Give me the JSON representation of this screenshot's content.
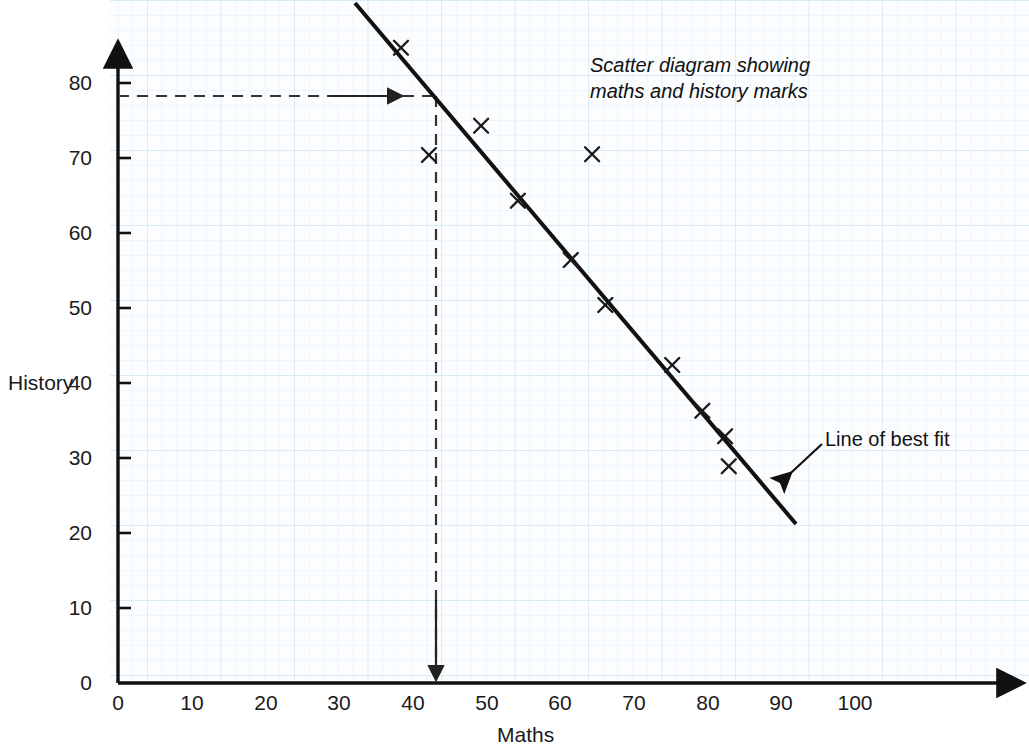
{
  "chart_data": {
    "type": "scatter",
    "title": "Scatter diagram showing maths and history marks",
    "title_line1": "Scatter diagram showing",
    "title_line2": "maths and history marks",
    "xlabel": "Maths",
    "ylabel": "History",
    "xlim": [
      0,
      115
    ],
    "ylim": [
      0,
      90
    ],
    "xticks": [
      0,
      10,
      20,
      30,
      40,
      50,
      60,
      70,
      80,
      90,
      100
    ],
    "yticks": [
      0,
      10,
      20,
      30,
      40,
      50,
      60,
      70,
      80
    ],
    "grid": true,
    "grid_color": "#d9e9f2",
    "marker": "x",
    "marker_color": "#1a1a1a",
    "points": [
      {
        "x": 38.5,
        "y": 84.7
      },
      {
        "x": 42.3,
        "y": 70.4
      },
      {
        "x": 49.4,
        "y": 74.3
      },
      {
        "x": 54.4,
        "y": 64.3
      },
      {
        "x": 61.6,
        "y": 56.4
      },
      {
        "x": 64.5,
        "y": 70.5
      },
      {
        "x": 66.3,
        "y": 50.4
      },
      {
        "x": 75.4,
        "y": 42.4
      },
      {
        "x": 79.5,
        "y": 36.3
      },
      {
        "x": 82.6,
        "y": 32.9
      },
      {
        "x": 83.1,
        "y": 28.9
      }
    ],
    "best_fit_line": {
      "label": "Line of best fit",
      "x_start": 32.2,
      "y_start": 90.7,
      "x_end": 92.2,
      "y_end": 21.2,
      "color": "#111111"
    },
    "annotations": [
      {
        "name": "reading-off-construction-lines",
        "style": "dashed",
        "horizontal_value": 78,
        "vertical_value": 43,
        "color": "#333333"
      }
    ]
  },
  "axes": {
    "y_tick_labels": [
      "80",
      "70",
      "60",
      "50",
      "40",
      "30",
      "20",
      "10",
      "0"
    ],
    "x_tick_labels": [
      "0",
      "10",
      "20",
      "30",
      "40",
      "50",
      "60",
      "70",
      "80",
      "90",
      "100"
    ],
    "y_axis_title": "History",
    "x_axis_title": "Maths"
  },
  "callouts": {
    "line_of_best_fit": "Line of best fit"
  }
}
